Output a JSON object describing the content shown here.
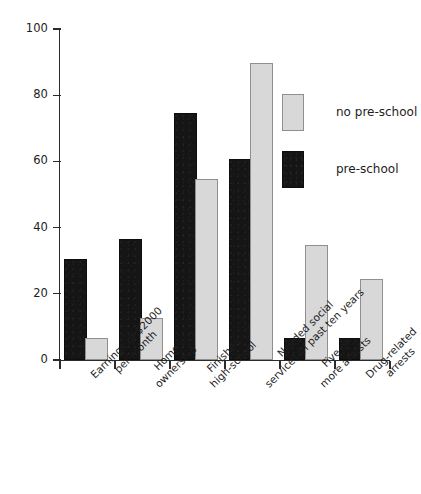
{
  "chart_data": {
    "type": "bar",
    "title": "",
    "subtitle": "",
    "xlabel": "",
    "ylabel": "",
    "ylim": [
      0,
      100
    ],
    "yticks": [
      0,
      20,
      40,
      60,
      80,
      100
    ],
    "grid": false,
    "legend_position": "top-right",
    "orientation": "vertical",
    "grouped": true,
    "categories": [
      "Earnings of $2000 per month",
      "Home ownership",
      "Finished high-school",
      "Needed social services in past ten years",
      "Five or more arrests",
      "Drug-related arrests"
    ],
    "category_lines": [
      [
        "Earnings of $2000",
        "per month"
      ],
      [
        "Home",
        "ownership"
      ],
      [
        "Finished",
        "high-school"
      ],
      [
        "Needed social",
        "services in past ten years"
      ],
      [
        "Five or",
        "more arrests"
      ],
      [
        "Drug-related",
        "arrests"
      ]
    ],
    "series": [
      {
        "name": "pre-school",
        "color": "#151515",
        "values": [
          30,
          36,
          74,
          60,
          6,
          6
        ]
      },
      {
        "name": "no pre-school",
        "color": "#d8d8d8",
        "values": [
          6,
          12,
          54,
          89,
          34,
          24
        ]
      }
    ]
  },
  "legend": {
    "entries": [
      {
        "label": "no pre-school",
        "swatch": "light"
      },
      {
        "label": "pre-school",
        "swatch": "dark"
      }
    ]
  },
  "axis": {
    "y_tick_labels": [
      "100",
      "80",
      "60",
      "40",
      "20",
      "0"
    ]
  }
}
